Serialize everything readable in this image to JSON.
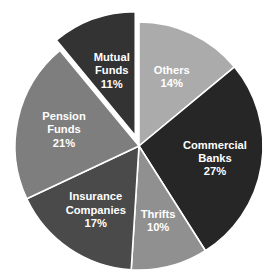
{
  "title": {
    "text": "",
    "visible": false,
    "note": "clipped-off-top-of-screenshot"
  },
  "chart_data": {
    "type": "pie",
    "title": "",
    "xlabel": "",
    "ylabel": "",
    "units": "percent",
    "total": 100,
    "start_angle_deg": 0,
    "direction": "clockwise",
    "grid": false,
    "legend": "none",
    "labels_inside_slices": true,
    "categories": [
      "Others",
      "Commercial Banks",
      "Thrifts",
      "Insurance Companies",
      "Pension Funds",
      "Mutual Funds"
    ],
    "values": [
      14,
      27,
      10,
      17,
      21,
      11
    ],
    "slices": [
      {
        "name": "Others",
        "label_line1": "Others",
        "label_line2": "",
        "percent_text": "14%",
        "value": 14,
        "color": "#ababab",
        "text_color": "#ffffff",
        "exploded": false
      },
      {
        "name": "Commercial Banks",
        "label_line1": "Commercial",
        "label_line2": "Banks",
        "percent_text": "27%",
        "value": 27,
        "color": "#262626",
        "text_color": "#ffffff",
        "exploded": false
      },
      {
        "name": "Thrifts",
        "label_line1": "Thrifts",
        "label_line2": "",
        "percent_text": "10%",
        "value": 10,
        "color": "#909090",
        "text_color": "#ffffff",
        "exploded": false
      },
      {
        "name": "Insurance Companies",
        "label_line1": "Insurance",
        "label_line2": "Companies",
        "percent_text": "17%",
        "value": 17,
        "color": "#4a4a4a",
        "text_color": "#ffffff",
        "exploded": false
      },
      {
        "name": "Pension Funds",
        "label_line1": "Pension",
        "label_line2": "Funds",
        "percent_text": "21%",
        "value": 21,
        "color": "#7e7e7e",
        "text_color": "#ffffff",
        "exploded": false
      },
      {
        "name": "Mutual Funds",
        "label_line1": "Mutual",
        "label_line2": "Funds",
        "percent_text": "11%",
        "value": 11,
        "color": "#333333",
        "text_color": "#ffffff",
        "exploded": true
      }
    ],
    "colors": {
      "background": "#ffffff",
      "slice_border": "#ffffff",
      "label_text": "#ffffff"
    }
  }
}
